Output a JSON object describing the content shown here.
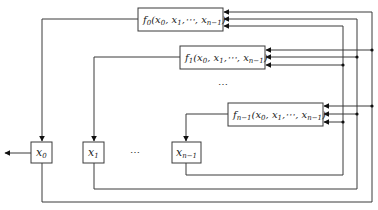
{
  "diagram": {
    "type": "feedback-shift-register",
    "functions": [
      {
        "id": "f0",
        "name": "f",
        "sub": "0",
        "args": "(x",
        "args_full": "f0(x0, x1,⋯, xn−1)"
      },
      {
        "id": "f1",
        "name": "f",
        "sub": "1",
        "args_full": "f1(x0, x1,⋯, xn−1)"
      },
      {
        "id": "fn-1",
        "name": "f",
        "sub": "n−1",
        "args_full": "fn−1(x0, x1,⋯, xn−1)"
      }
    ],
    "registers": [
      {
        "id": "x0",
        "name": "x",
        "sub": "0"
      },
      {
        "id": "x1",
        "name": "x",
        "sub": "1"
      },
      {
        "id": "xn-1",
        "name": "x",
        "sub": "n−1"
      }
    ],
    "arg_text": {
      "open": "(",
      "x": "x",
      "s0": "0",
      "s1": "1",
      "sn": "n−1",
      "comma": ",",
      "cdots": "⋯,",
      "close": ")"
    },
    "ellipsis_vertical": "⋯",
    "ellipsis_horizontal": "⋯",
    "output_arrow": "output from x0"
  }
}
